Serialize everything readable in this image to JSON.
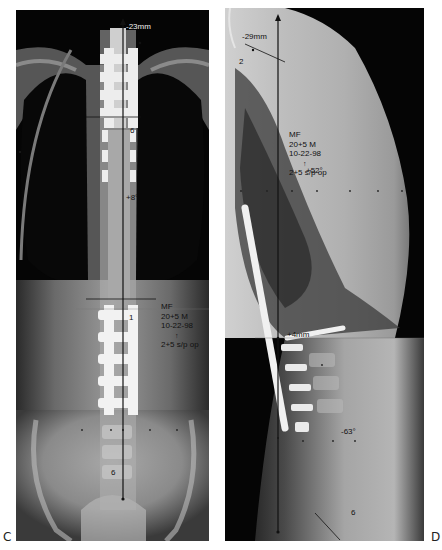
{
  "figure": {
    "panels": [
      {
        "id": "C",
        "label": "C",
        "view": "AP",
        "annotations": {
          "top_offset": "-23mm",
          "upper_level": "6",
          "angle": "+8°",
          "lower_level": "1",
          "bottom_level": "6",
          "patient_block": [
            "MF",
            "20+5 M",
            "10-22-98",
            "↑",
            "2+5 s/p op"
          ]
        }
      },
      {
        "id": "D",
        "label": "D",
        "view": "Lateral",
        "annotations": {
          "top_offset": "-29mm",
          "upper_level": "2",
          "kyphosis_angle": "+52°",
          "patient_block": [
            "MF",
            "20+5 M",
            "10-22-98",
            "↑",
            "2+5 s/p op"
          ],
          "mid_offset": "+4mm",
          "lordosis_angle": "-63°",
          "bottom_level": "6"
        }
      }
    ],
    "colors": {
      "background": "#ffffff",
      "film_dark": "#050505",
      "bone_light": "#d8d8d8",
      "implant": "#f4f4f4",
      "plumb_line": "#111111"
    }
  }
}
